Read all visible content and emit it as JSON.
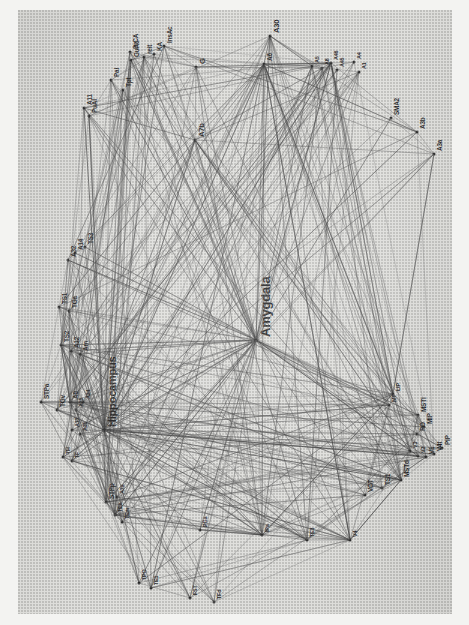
{
  "figure": {
    "type": "brain-connectivity-network-graph",
    "title_visible": false,
    "orientation_note": "figure printed rotated 90 degrees; labels read bottom-to-top",
    "background_color": "#dfdfdc",
    "page_color": "#f3f3f1",
    "edge_color": "#3c3c3c",
    "node_color": "#2a2a2a",
    "label_color": "#1c1c1c",
    "emphasis_labels": [
      "Amygdala",
      "Hippocampus"
    ]
  },
  "chart_data": {
    "type": "scatter",
    "title": "",
    "xlabel": "",
    "ylabel": "",
    "nodes": [
      {
        "id": "A30",
        "label": "A30",
        "x": 252,
        "y": 26,
        "size": "m"
      },
      {
        "id": "G",
        "label": "G",
        "x": 178,
        "y": 57,
        "size": "m"
      },
      {
        "id": "InsAc",
        "label": "InsAc",
        "x": 146,
        "y": 36,
        "size": "s"
      },
      {
        "id": "KA",
        "label": "KA",
        "x": 136,
        "y": 44,
        "size": "s"
      },
      {
        "id": "Reit",
        "label": "reit",
        "x": 126,
        "y": 47,
        "size": "s"
      },
      {
        "id": "GuAc",
        "label": "GuAc",
        "x": 113,
        "y": 50,
        "size": "s"
      },
      {
        "id": "PrCA",
        "label": "PrCA",
        "x": 112,
        "y": 42,
        "size": "s"
      },
      {
        "id": "Pal",
        "label": "Pal",
        "x": 93,
        "y": 70,
        "size": "s"
      },
      {
        "id": "Tpt",
        "label": "Tpt",
        "x": 105,
        "y": 80,
        "size": "s"
      },
      {
        "id": "A11",
        "label": "A11",
        "x": 66,
        "y": 98,
        "size": "s"
      },
      {
        "id": "PuAI",
        "label": "PuAI",
        "x": 71,
        "y": 106,
        "size": "s"
      },
      {
        "id": "A7b",
        "label": "A7b",
        "x": 177,
        "y": 130,
        "size": "m"
      },
      {
        "id": "A6",
        "label": "A6",
        "x": 246,
        "y": 54,
        "size": "s"
      },
      {
        "id": "A5",
        "label": "A5",
        "x": 294,
        "y": 56,
        "size": "xs"
      },
      {
        "id": "A8",
        "label": "A8",
        "x": 304,
        "y": 58,
        "size": "xs"
      },
      {
        "id": "A46",
        "label": "A46",
        "x": 313,
        "y": 53,
        "size": "xs"
      },
      {
        "id": "A45",
        "label": "A45",
        "x": 319,
        "y": 60,
        "size": "xs"
      },
      {
        "id": "A4",
        "label": "A4",
        "x": 336,
        "y": 52,
        "size": "xs"
      },
      {
        "id": "A1",
        "label": "A1",
        "x": 341,
        "y": 62,
        "size": "xs"
      },
      {
        "id": "SMA2",
        "label": "SMA2",
        "x": 373,
        "y": 108,
        "size": "s"
      },
      {
        "id": "A3b",
        "label": "A3b",
        "x": 399,
        "y": 122,
        "size": "s"
      },
      {
        "id": "A3a",
        "label": "A3a",
        "x": 416,
        "y": 144,
        "size": "s"
      },
      {
        "id": "A32",
        "label": "A32",
        "x": 50,
        "y": 250,
        "size": "s"
      },
      {
        "id": "A14",
        "label": "A14",
        "x": 57,
        "y": 243,
        "size": "s"
      },
      {
        "id": "TS3",
        "label": "TS3",
        "x": 67,
        "y": 237,
        "size": "s"
      },
      {
        "id": "TS1",
        "label": "TS1",
        "x": 41,
        "y": 297,
        "size": "s"
      },
      {
        "id": "TGa",
        "label": "TGa",
        "x": 51,
        "y": 301,
        "size": "s"
      },
      {
        "id": "TS2",
        "label": "TS2",
        "x": 43,
        "y": 335,
        "size": "s"
      },
      {
        "id": "A12",
        "label": "A12",
        "x": 53,
        "y": 341,
        "size": "s"
      },
      {
        "id": "Am",
        "label": "Am",
        "x": 62,
        "y": 344,
        "size": "s"
      },
      {
        "id": "STPa",
        "label": "STPa",
        "x": 23,
        "y": 392,
        "size": "s"
      },
      {
        "id": "TGv",
        "label": "TGv",
        "x": 39,
        "y": 400,
        "size": "s"
      },
      {
        "id": "A9",
        "label": "A9",
        "x": 52,
        "y": 392,
        "size": "s"
      },
      {
        "id": "A25",
        "label": "A25",
        "x": 58,
        "y": 400,
        "size": "xs"
      },
      {
        "id": "A24",
        "label": "A24",
        "x": 65,
        "y": 392,
        "size": "xs"
      },
      {
        "id": "A13",
        "label": "A13",
        "x": 54,
        "y": 420,
        "size": "xs"
      },
      {
        "id": "A35",
        "label": "A35",
        "x": 62,
        "y": 424,
        "size": "xs"
      },
      {
        "id": "TH",
        "label": "TH",
        "x": 45,
        "y": 447,
        "size": "xs"
      },
      {
        "id": "TF",
        "label": "TF",
        "x": 54,
        "y": 451,
        "size": "xs"
      },
      {
        "id": "Hippocampus",
        "label": "Hippocampus",
        "x": 86,
        "y": 420,
        "size": "l"
      },
      {
        "id": "Amygdala",
        "label": "Amygdala",
        "x": 238,
        "y": 330,
        "size": "xl"
      },
      {
        "id": "STPp",
        "label": "STPp",
        "x": 88,
        "y": 492,
        "size": "s"
      },
      {
        "id": "A7a",
        "label": "A7a",
        "x": 99,
        "y": 487,
        "size": "xs"
      },
      {
        "id": "TEa",
        "label": "TEa",
        "x": 97,
        "y": 505,
        "size": "xs"
      },
      {
        "id": "TEm",
        "label": "TEm",
        "x": 104,
        "y": 512,
        "size": "xs"
      },
      {
        "id": "TPO",
        "label": "TPO",
        "x": 121,
        "y": 573,
        "size": "xs"
      },
      {
        "id": "TE1",
        "label": "TE1",
        "x": 133,
        "y": 578,
        "size": "xs"
      },
      {
        "id": "FST",
        "label": "FST",
        "x": 172,
        "y": 588,
        "size": "xs"
      },
      {
        "id": "TFd",
        "label": "TFd",
        "x": 196,
        "y": 592,
        "size": "xs"
      },
      {
        "id": "PGa",
        "label": "PGa",
        "x": 182,
        "y": 520,
        "size": "xs"
      },
      {
        "id": "IPa",
        "label": "IPa",
        "x": 244,
        "y": 525,
        "size": "xs"
      },
      {
        "id": "TE3",
        "label": "TE3",
        "x": 289,
        "y": 530,
        "size": "xs"
      },
      {
        "id": "V4",
        "label": "V4",
        "x": 332,
        "y": 530,
        "size": "xs"
      },
      {
        "id": "VOT",
        "label": "VOT",
        "x": 347,
        "y": 485,
        "size": "s"
      },
      {
        "id": "TS1b",
        "label": "TS1",
        "x": 364,
        "y": 478,
        "size": "s"
      },
      {
        "id": "MSTd",
        "label": "MSTd",
        "x": 383,
        "y": 470,
        "size": "s"
      },
      {
        "id": "MSTl",
        "label": "MSTl",
        "x": 400,
        "y": 405,
        "size": "s"
      },
      {
        "id": "PO",
        "label": "PO",
        "x": 399,
        "y": 424,
        "size": "s"
      },
      {
        "id": "MIP",
        "label": "MIP",
        "x": 406,
        "y": 417,
        "size": "s"
      },
      {
        "id": "V3",
        "label": "V3",
        "x": 392,
        "y": 441,
        "size": "xs"
      },
      {
        "id": "V2",
        "label": "V2",
        "x": 400,
        "y": 446,
        "size": "xs"
      },
      {
        "id": "V1",
        "label": "V1",
        "x": 408,
        "y": 447,
        "size": "s"
      },
      {
        "id": "V4t",
        "label": "V4t",
        "x": 416,
        "y": 444,
        "size": "s"
      },
      {
        "id": "PIP",
        "label": "PIP",
        "x": 424,
        "y": 438,
        "size": "s"
      },
      {
        "id": "LIP",
        "label": "LIP",
        "x": 375,
        "y": 384,
        "size": "xs"
      },
      {
        "id": "MT",
        "label": "MT",
        "x": 371,
        "y": 395,
        "size": "xs"
      }
    ],
    "edge_count_approx": 400,
    "legend": [],
    "grid": false
  }
}
